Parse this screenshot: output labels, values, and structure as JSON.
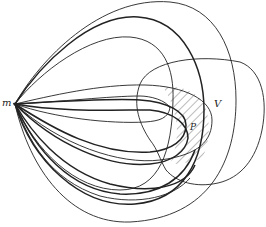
{
  "figure": {
    "labels": {
      "point": "m",
      "region_v": "V",
      "region_p": "P"
    },
    "colors": {
      "stroke": "#222222",
      "background": "#ffffff",
      "hatch": "#555555"
    }
  }
}
